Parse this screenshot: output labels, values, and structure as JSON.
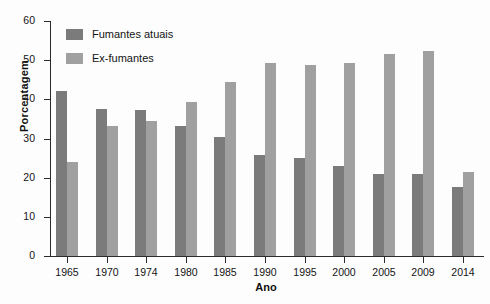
{
  "chart_data": {
    "type": "bar",
    "title": "",
    "xlabel": "Ano",
    "ylabel": "Porcentagem",
    "categories": [
      "1965",
      "1970",
      "1974",
      "1980",
      "1985",
      "1990",
      "1995",
      "2000",
      "2005",
      "2009",
      "2014"
    ],
    "series": [
      {
        "name": "Fumantes atuais",
        "color": "#7b7b7b",
        "values": [
          42.2,
          37.5,
          37.2,
          33.3,
          30.5,
          25.8,
          25.0,
          23.1,
          21.0,
          21.0,
          17.5
        ]
      },
      {
        "name": "Ex-fumantes",
        "color": "#a0a0a0",
        "values": [
          24.0,
          33.2,
          34.5,
          39.2,
          44.5,
          49.3,
          48.8,
          49.2,
          51.5,
          52.3,
          21.5
        ]
      }
    ],
    "ylim": [
      0,
      60
    ],
    "yticks": [
      0,
      10,
      20,
      30,
      40,
      50,
      60
    ],
    "ytick_labels": [
      "0",
      "10",
      "20",
      "30",
      "40",
      "50",
      "60"
    ],
    "grid": false,
    "legend_position": "top-left",
    "legend": [
      "Fumantes atuais",
      "Ex-fumantes"
    ]
  }
}
